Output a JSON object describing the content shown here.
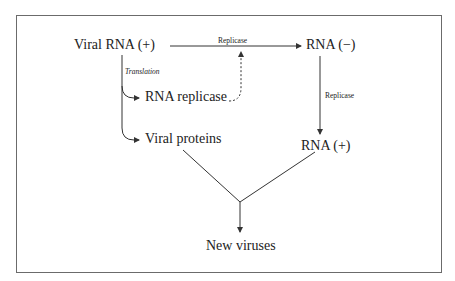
{
  "diagram": {
    "nodes": {
      "viral_rna_plus": "Viral RNA (+)",
      "rna_minus": "RNA (−)",
      "rna_replicase": "RNA replicase",
      "viral_proteins": "Viral proteins",
      "rna_plus": "RNA (+)",
      "new_viruses": "New viruses"
    },
    "edge_labels": {
      "top_replicase": "Replicase",
      "right_replicase": "Replicase",
      "translation": "Translation"
    },
    "edges": [
      {
        "from": "Viral RNA (+)",
        "to": "RNA (−)",
        "label": "Replicase",
        "style": "solid"
      },
      {
        "from": "RNA (−)",
        "to": "RNA (+)",
        "label": "Replicase",
        "style": "solid"
      },
      {
        "from": "Viral RNA (+)",
        "to": "RNA replicase",
        "label": "Translation",
        "style": "solid"
      },
      {
        "from": "Viral RNA (+)",
        "to": "Viral proteins",
        "label": "Translation",
        "style": "solid"
      },
      {
        "from": "RNA replicase",
        "to": "Replicase step",
        "label": "",
        "style": "dashed"
      },
      {
        "from": "Viral proteins",
        "to": "New viruses",
        "label": "",
        "style": "solid"
      },
      {
        "from": "RNA (+)",
        "to": "New viruses",
        "label": "",
        "style": "solid"
      }
    ],
    "colors": {
      "line": "#333333",
      "frame": "#6b6b6b",
      "text": "#222222"
    }
  }
}
